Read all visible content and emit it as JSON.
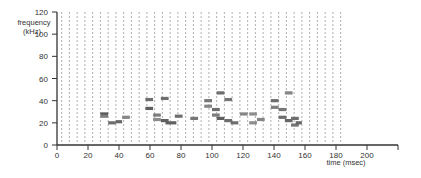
{
  "chart_data": {
    "type": "spectrogram-segments",
    "title": "",
    "xlabel": "time (msec)",
    "ylabel": "frequency (kHz)",
    "ylabel_lines": [
      "frequency",
      "(kHz)"
    ],
    "xlim": [
      0,
      220
    ],
    "ylim": [
      0,
      120
    ],
    "x_ticks": [
      0,
      20,
      40,
      60,
      80,
      100,
      120,
      140,
      160,
      180,
      200
    ],
    "y_ticks": [
      0,
      20,
      40,
      60,
      80,
      100,
      120
    ],
    "grid": {
      "vertical_dashed": true,
      "spacing_msec": 5,
      "start_msec": 3,
      "end_msec": 183
    },
    "legend": null,
    "segments": [
      {
        "t0": 28,
        "t1": 33,
        "f": 28,
        "intensity": 0.75
      },
      {
        "t0": 28,
        "t1": 33,
        "f": 26,
        "intensity": 0.5
      },
      {
        "t0": 33,
        "t1": 38,
        "f": 20,
        "intensity": 0.6
      },
      {
        "t0": 38,
        "t1": 42,
        "f": 21,
        "intensity": 0.65
      },
      {
        "t0": 42,
        "t1": 47,
        "f": 25,
        "intensity": 0.45
      },
      {
        "t0": 57,
        "t1": 62,
        "f": 41,
        "intensity": 0.6
      },
      {
        "t0": 57,
        "t1": 62,
        "f": 33,
        "intensity": 0.7
      },
      {
        "t0": 62,
        "t1": 67,
        "f": 27,
        "intensity": 0.5
      },
      {
        "t0": 62,
        "t1": 67,
        "f": 23,
        "intensity": 0.4
      },
      {
        "t0": 67,
        "t1": 72,
        "f": 42,
        "intensity": 0.6
      },
      {
        "t0": 67,
        "t1": 72,
        "f": 22,
        "intensity": 0.7
      },
      {
        "t0": 70,
        "t1": 77,
        "f": 20,
        "intensity": 0.7
      },
      {
        "t0": 76,
        "t1": 81,
        "f": 26,
        "intensity": 0.6
      },
      {
        "t0": 86,
        "t1": 91,
        "f": 24,
        "intensity": 0.55
      },
      {
        "t0": 95,
        "t1": 100,
        "f": 40,
        "intensity": 0.55
      },
      {
        "t0": 95,
        "t1": 100,
        "f": 35,
        "intensity": 0.45
      },
      {
        "t0": 100,
        "t1": 105,
        "f": 32,
        "intensity": 0.6
      },
      {
        "t0": 100,
        "t1": 105,
        "f": 27,
        "intensity": 0.5
      },
      {
        "t0": 103,
        "t1": 108,
        "f": 47,
        "intensity": 0.6
      },
      {
        "t0": 103,
        "t1": 108,
        "f": 24,
        "intensity": 0.7
      },
      {
        "t0": 108,
        "t1": 113,
        "f": 41,
        "intensity": 0.55
      },
      {
        "t0": 108,
        "t1": 113,
        "f": 22,
        "intensity": 0.6
      },
      {
        "t0": 112,
        "t1": 117,
        "f": 20,
        "intensity": 0.6
      },
      {
        "t0": 118,
        "t1": 123,
        "f": 28,
        "intensity": 0.45
      },
      {
        "t0": 124,
        "t1": 129,
        "f": 28,
        "intensity": 0.4
      },
      {
        "t0": 124,
        "t1": 129,
        "f": 20,
        "intensity": 0.4
      },
      {
        "t0": 129,
        "t1": 134,
        "f": 23,
        "intensity": 0.45
      },
      {
        "t0": 138,
        "t1": 143,
        "f": 40,
        "intensity": 0.6
      },
      {
        "t0": 138,
        "t1": 143,
        "f": 34,
        "intensity": 0.5
      },
      {
        "t0": 143,
        "t1": 148,
        "f": 32,
        "intensity": 0.55
      },
      {
        "t0": 143,
        "t1": 148,
        "f": 25,
        "intensity": 0.6
      },
      {
        "t0": 147,
        "t1": 152,
        "f": 47,
        "intensity": 0.45
      },
      {
        "t0": 147,
        "t1": 152,
        "f": 22,
        "intensity": 0.65
      },
      {
        "t0": 151,
        "t1": 156,
        "f": 24,
        "intensity": 0.6
      },
      {
        "t0": 151,
        "t1": 156,
        "f": 18,
        "intensity": 0.55
      },
      {
        "t0": 154,
        "t1": 158,
        "f": 20,
        "intensity": 0.65
      }
    ]
  },
  "colors": {
    "axis": "#333333",
    "grid": "#9a9a9a",
    "segment_dark": "#444444",
    "segment_light": "#aaaaaa"
  }
}
